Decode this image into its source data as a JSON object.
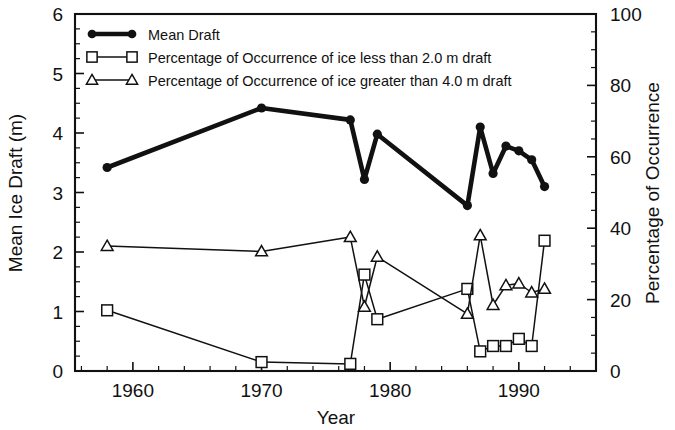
{
  "chart_data": {
    "type": "line",
    "title": "",
    "xlabel": "Year",
    "ylabel": "Mean Ice Draft (m)",
    "y2label": "Percentage of Occurrence",
    "xlim": [
      1955.5,
      1996.0
    ],
    "ylim": [
      0,
      6
    ],
    "y2lim": [
      0,
      100
    ],
    "grid": false,
    "xticks": [
      1960,
      1970,
      1980,
      1990
    ],
    "xtick_labels": [
      "1960",
      "1970",
      "1980",
      "1990"
    ],
    "xminor_step": 2,
    "yticks": [
      0,
      1,
      2,
      3,
      4,
      5,
      6
    ],
    "ytick_labels": [
      "0",
      "1",
      "2",
      "3",
      "4",
      "5",
      "6"
    ],
    "yminor_step": 0.25,
    "y2ticks": [
      0,
      20,
      40,
      60,
      80,
      100
    ],
    "y2tick_labels": [
      "0",
      "20",
      "40",
      "60",
      "80",
      "100"
    ],
    "legend_position": "top-left",
    "series": [
      {
        "name": "Mean Draft",
        "marker": "filled-circle",
        "axis": "left",
        "units": "m",
        "x": [
          1958,
          1970,
          1976.9,
          1978,
          1979,
          1986,
          1987,
          1988,
          1989,
          1990,
          1991,
          1992
        ],
        "values": [
          3.42,
          4.42,
          4.22,
          3.22,
          3.98,
          2.78,
          4.1,
          3.32,
          3.78,
          3.7,
          3.55,
          3.1
        ]
      },
      {
        "name": "Percentage of Occurrence of ice less than 2.0 m draft",
        "marker": "open-square",
        "axis": "right",
        "units": "%",
        "x": [
          1958,
          1970,
          1976.9,
          1978,
          1979,
          1986,
          1987,
          1988,
          1989,
          1990,
          1991,
          1992
        ],
        "values": [
          17,
          2.5,
          2.0,
          27,
          14.5,
          23,
          5.5,
          7,
          7,
          9,
          7,
          36.5
        ]
      },
      {
        "name": "Percentage of Occurrence of ice greater than 4.0 m draft",
        "marker": "open-triangle",
        "axis": "right",
        "units": "%",
        "x": [
          1958,
          1970,
          1976.9,
          1978,
          1979,
          1986,
          1987,
          1988,
          1989,
          1990,
          1991,
          1992
        ],
        "values": [
          35,
          33.5,
          37.5,
          18,
          32,
          16,
          38,
          18.5,
          24,
          24.5,
          22,
          23
        ]
      }
    ]
  },
  "legend": {
    "entries": [
      {
        "label": "Mean Draft",
        "marker": "filled-circle"
      },
      {
        "label": "Percentage of Occurrence of ice less than 2.0 m draft",
        "marker": "open-square"
      },
      {
        "label": "Percentage of Occurrence of ice greater than 4.0 m draft",
        "marker": "open-triangle"
      }
    ]
  }
}
